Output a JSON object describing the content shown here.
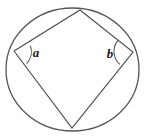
{
  "figure": {
    "name": "cyclic-quadrilateral-in-circle",
    "background_color": "#ffffff",
    "stroke_color": "#4a4a52",
    "label_color": "#1c1c1c",
    "canvas": {
      "width": 146,
      "height": 139
    },
    "circle": {
      "name": "circumscribed-circle",
      "cx": 72.5,
      "cy": 69.5,
      "rx": 66.5,
      "ry": 61.5,
      "stroke_width": 1.3
    },
    "vertices": [
      {
        "id": "top",
        "label": "",
        "x": 80,
        "y": 10
      },
      {
        "id": "right",
        "label": "b",
        "x": 133,
        "y": 52
      },
      {
        "id": "bottom",
        "label": "",
        "x": 72,
        "y": 128
      },
      {
        "id": "left",
        "label": "a",
        "x": 14,
        "y": 51
      }
    ],
    "edges": [
      {
        "id": "edge-left-top",
        "from": "left",
        "to": "top"
      },
      {
        "id": "edge-top-right",
        "from": "top",
        "to": "right"
      },
      {
        "id": "edge-right-bottom",
        "from": "right",
        "to": "bottom"
      },
      {
        "id": "edge-bottom-left",
        "from": "bottom",
        "to": "left"
      }
    ],
    "angle_marks": [
      {
        "id": "angle-a",
        "label": "a",
        "at_vertex": "left",
        "label_x": 36,
        "label_y": 57,
        "arc_path": "M 30.4 45.8 A 17 17 0 0 1 26.6 63.6",
        "stroke_width": 1.1
      },
      {
        "id": "angle-b",
        "label": "b",
        "at_vertex": "right",
        "label_x": 110,
        "label_y": 58,
        "arc_path": "M 117.9 40.3 A 17.5 17.5 0 0 0 119.8 64.4",
        "stroke_width": 1.1
      }
    ],
    "polyline_points": "14,51 80,10 133,52 72,128 14,51"
  }
}
